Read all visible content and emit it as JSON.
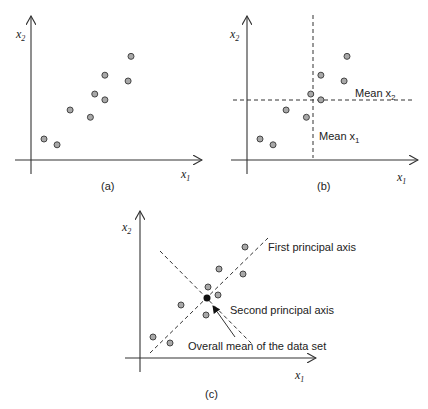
{
  "figure": {
    "panels": [
      {
        "id": "a",
        "caption": "(a)",
        "x_axis_label": "x",
        "x_axis_sub": "1",
        "y_axis_label": "x",
        "y_axis_sub": "2",
        "points": [
          [
            1.0,
            1.4
          ],
          [
            1.9,
            1.0
          ],
          [
            2.8,
            3.4
          ],
          [
            4.2,
            2.9
          ],
          [
            4.5,
            4.5
          ],
          [
            5.2,
            4.1
          ],
          [
            5.2,
            5.8
          ],
          [
            6.8,
            5.4
          ],
          [
            7.0,
            7.1
          ]
        ]
      },
      {
        "id": "b",
        "caption": "(b)",
        "x_axis_label": "x",
        "x_axis_sub": "1",
        "y_axis_label": "x",
        "y_axis_sub": "2",
        "mean_x1_label": "Mean x",
        "mean_x1_sub": "1",
        "mean_x2_label": "Mean x",
        "mean_x2_sub": "2",
        "points": [
          [
            1.0,
            1.4
          ],
          [
            1.9,
            1.0
          ],
          [
            2.8,
            3.4
          ],
          [
            4.2,
            2.9
          ],
          [
            4.5,
            4.5
          ],
          [
            5.2,
            4.1
          ],
          [
            5.2,
            5.8
          ],
          [
            6.8,
            5.4
          ],
          [
            7.0,
            7.1
          ]
        ]
      },
      {
        "id": "c",
        "caption": "(c)",
        "x_axis_label": "x",
        "x_axis_sub": "1",
        "y_axis_label": "x",
        "y_axis_sub": "2",
        "first_axis_label": "First principal axis",
        "second_axis_label": "Second principal axis",
        "mean_label": "Overall mean of the data set",
        "points": [
          [
            1.0,
            1.4
          ],
          [
            1.9,
            1.0
          ],
          [
            2.8,
            3.4
          ],
          [
            4.2,
            2.9
          ],
          [
            4.5,
            4.5
          ],
          [
            5.2,
            4.1
          ],
          [
            5.2,
            5.8
          ],
          [
            6.8,
            5.4
          ],
          [
            7.0,
            7.1
          ]
        ]
      }
    ]
  }
}
